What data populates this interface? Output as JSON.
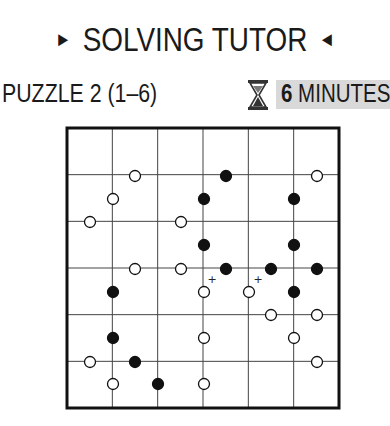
{
  "header": {
    "title": "SOLVING TUTOR",
    "left_arrow_icon": "right-pointing-triangle",
    "right_arrow_icon": "left-pointing-triangle"
  },
  "puzzle": {
    "label": "PUZZLE 2 (1–6)",
    "timer": {
      "icon": "hourglass-icon",
      "value": "6",
      "unit": "MINUTES",
      "background": "#d9d9d9"
    },
    "grid": {
      "columns": 6,
      "rows": 6,
      "left": 67,
      "top": 128,
      "right": 339,
      "bottom": 408,
      "circles": [
        {
          "x": 135,
          "y": 176,
          "color": "white"
        },
        {
          "x": 226,
          "y": 176,
          "color": "black"
        },
        {
          "x": 317,
          "y": 176,
          "color": "white"
        },
        {
          "x": 113,
          "y": 199,
          "color": "white"
        },
        {
          "x": 204,
          "y": 199,
          "color": "black"
        },
        {
          "x": 294,
          "y": 199,
          "color": "black"
        },
        {
          "x": 90,
          "y": 222,
          "color": "white"
        },
        {
          "x": 181,
          "y": 222,
          "color": "white"
        },
        {
          "x": 204,
          "y": 245,
          "color": "black"
        },
        {
          "x": 294,
          "y": 245,
          "color": "black"
        },
        {
          "x": 135,
          "y": 269,
          "color": "white"
        },
        {
          "x": 181,
          "y": 269,
          "color": "white"
        },
        {
          "x": 226,
          "y": 269,
          "color": "black"
        },
        {
          "x": 271,
          "y": 269,
          "color": "black"
        },
        {
          "x": 317,
          "y": 269,
          "color": "black"
        },
        {
          "x": 113,
          "y": 292,
          "color": "black"
        },
        {
          "x": 204,
          "y": 292,
          "color": "white"
        },
        {
          "x": 249,
          "y": 292,
          "color": "white"
        },
        {
          "x": 294,
          "y": 292,
          "color": "black"
        },
        {
          "x": 271,
          "y": 315,
          "color": "white"
        },
        {
          "x": 317,
          "y": 315,
          "color": "white"
        },
        {
          "x": 113,
          "y": 338,
          "color": "black"
        },
        {
          "x": 204,
          "y": 338,
          "color": "white"
        },
        {
          "x": 294,
          "y": 338,
          "color": "white"
        },
        {
          "x": 90,
          "y": 362,
          "color": "white"
        },
        {
          "x": 135,
          "y": 362,
          "color": "black"
        },
        {
          "x": 317,
          "y": 362,
          "color": "white"
        },
        {
          "x": 113,
          "y": 384,
          "color": "white"
        },
        {
          "x": 158,
          "y": 384,
          "color": "black"
        },
        {
          "x": 204,
          "y": 384,
          "color": "white"
        }
      ],
      "markers": [
        {
          "x": 212,
          "y": 279,
          "symbol": "+"
        },
        {
          "x": 258,
          "y": 279,
          "symbol": "+"
        }
      ]
    }
  }
}
